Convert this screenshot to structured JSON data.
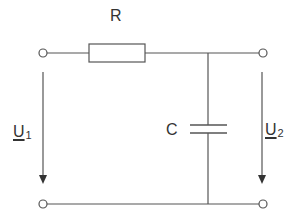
{
  "diagram": {
    "type": "circuit-schematic",
    "components": {
      "resistor": {
        "label": "R"
      },
      "capacitor": {
        "label": "C"
      }
    },
    "voltages": {
      "input": {
        "symbol": "U",
        "subscript": "1"
      },
      "output": {
        "symbol": "U",
        "subscript": "2"
      }
    },
    "colors": {
      "line": "#555555",
      "text": "#333333",
      "background": "#ffffff"
    }
  }
}
